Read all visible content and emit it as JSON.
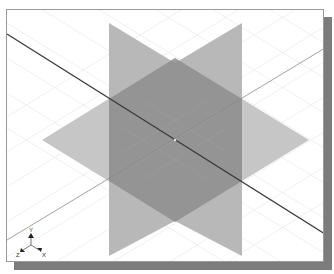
{
  "scene": {
    "description": "3D modeling viewport showing three orthogonal datum planes in isometric view",
    "planes": [
      {
        "name": "Front plane",
        "orientation": "vertical-left",
        "color": "#a8a8a8"
      },
      {
        "name": "Right plane",
        "orientation": "vertical-right",
        "color": "#a8a8a8"
      },
      {
        "name": "Top plane",
        "orientation": "horizontal",
        "color": "#c4c4c4"
      }
    ],
    "axes": {
      "main_axis_color": "#3a3a3a",
      "secondary_axis_color": "#8a8a8a"
    },
    "grid": {
      "visible": true,
      "color": "#e4e4e4"
    }
  },
  "triad": {
    "x_label": "X",
    "y_label": "Y",
    "z_label": "Z"
  },
  "colors": {
    "frame_border": "#9a9a9a",
    "shadow": "#7c7c7c",
    "background": "#ffffff"
  }
}
